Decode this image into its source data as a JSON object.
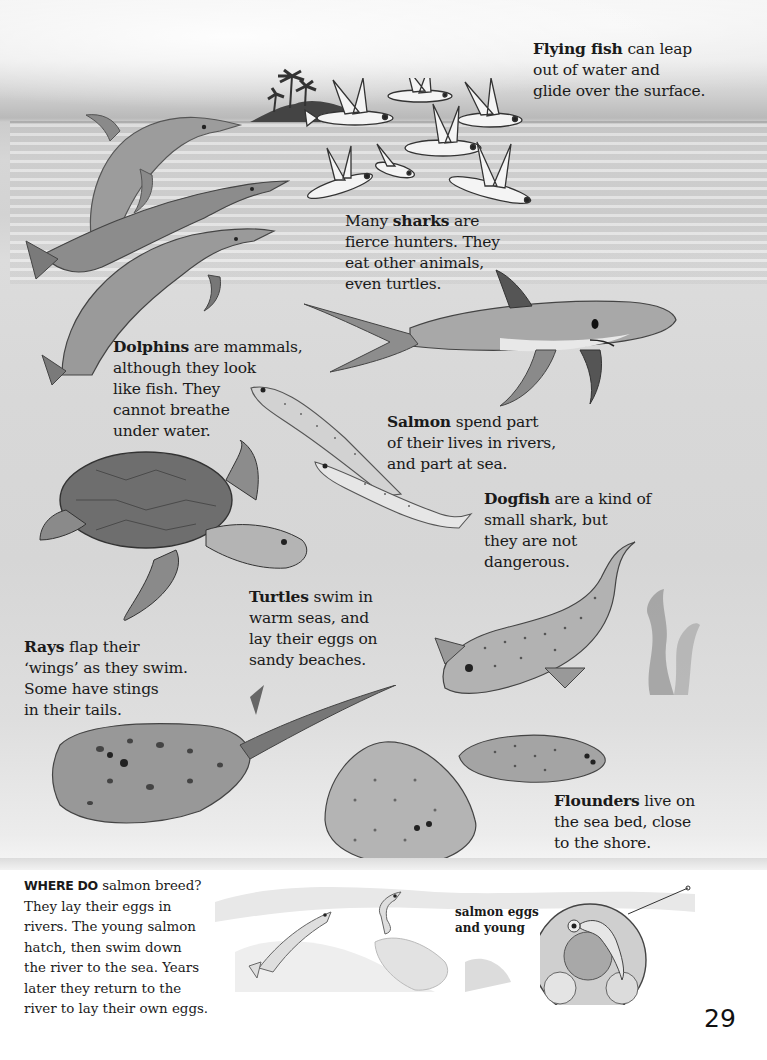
{
  "page": {
    "number": "29",
    "palette": {
      "background": "#ffffff",
      "sky": "#ececec",
      "sea_surface": "#cfcfcf",
      "sea_deep": "#d6d6d6",
      "ink": "#1a1a1a"
    }
  },
  "captions": {
    "flying_fish": {
      "bold": "Flying fish",
      "lines": [
        "can leap",
        "out of water and",
        "glide over the surface."
      ]
    },
    "sharks": {
      "prefix": "Many",
      "bold": "sharks",
      "lines": [
        "are",
        "fierce hunters. They",
        "eat other animals,",
        "even turtles."
      ]
    },
    "dolphins": {
      "bold": "Dolphins",
      "lines": [
        "are mammals,",
        "although they look",
        "like fish. They",
        "cannot breathe",
        "under water."
      ]
    },
    "salmon": {
      "bold": "Salmon",
      "lines": [
        "spend part",
        "of their lives in rivers,",
        "and part at sea."
      ]
    },
    "dogfish": {
      "bold": "Dogfish",
      "lines": [
        "are a kind of",
        "small shark, but",
        "they are not",
        "dangerous."
      ]
    },
    "turtles": {
      "bold": "Turtles",
      "lines": [
        "swim in",
        "warm seas, and",
        "lay their eggs on",
        "sandy beaches."
      ]
    },
    "rays": {
      "bold": "Rays",
      "lines": [
        "flap their",
        "‘wings’ as they swim.",
        "Some have stings",
        "in their tails."
      ]
    },
    "flounders": {
      "bold": "Flounders",
      "lines": [
        "live on",
        "the sea bed, close",
        "to the shore."
      ]
    }
  },
  "info_box": {
    "kicker": "WHERE DO",
    "lines": [
      "salmon breed?",
      "They lay their eggs in",
      "rivers. The young salmon",
      "hatch, then swim down",
      "the river to the sea. Years",
      "later they return to the",
      "river to lay their own eggs."
    ]
  },
  "inset": {
    "label_lines": [
      "salmon eggs",
      "and young"
    ]
  },
  "illustrations": [
    "island-with-palms",
    "flying-fish-school",
    "dolphin-leaping",
    "dolphin-pair",
    "shark",
    "salmon-pair",
    "sea-turtle",
    "dogfish",
    "stingray",
    "flounder-large",
    "flounder-small",
    "seaweed",
    "river-salmon",
    "salmon-egg-magnifier"
  ]
}
